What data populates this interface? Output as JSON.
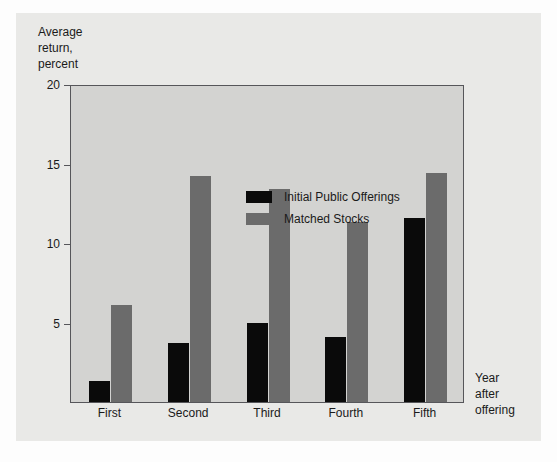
{
  "chart_data": {
    "type": "bar",
    "title": "",
    "subtitle": "",
    "ylabel": "Average\nreturn,\npercent",
    "xlabel": "Year\nafter\noffering",
    "categories": [
      "First",
      "Second",
      "Third",
      "Fourth",
      "Fifth"
    ],
    "series": [
      {
        "name": "Initial Public Offerings",
        "color": "#0a0a0a",
        "values": [
          1.3,
          3.7,
          5.0,
          4.1,
          11.6
        ]
      },
      {
        "name": "Matched Stocks",
        "color": "#6b6b6b",
        "values": [
          6.1,
          14.2,
          13.4,
          11.3,
          14.4
        ]
      }
    ],
    "ylim": [
      0,
      20
    ],
    "yticks": [
      20,
      15,
      10,
      5
    ],
    "ytick_labels": [
      "20",
      "15",
      "10",
      "5"
    ],
    "grid": false,
    "legend_position": "top-center-inside",
    "plot_background": "#d3d3d1",
    "figure_background": "#e9e9e7",
    "axis_color": "#56565a"
  },
  "legend": {
    "items": [
      {
        "label": "Initial Public Offerings",
        "swatch": "ipo"
      },
      {
        "label": "Matched Stocks",
        "swatch": "match"
      }
    ]
  }
}
